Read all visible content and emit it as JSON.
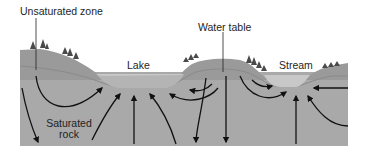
{
  "diagram": {
    "type": "groundwater-flow-cross-section",
    "labels": {
      "unsaturated_zone": "Unsaturated zone",
      "water_table": "Water table",
      "lake": "Lake",
      "stream": "Stream",
      "saturated_rock_line1": "Saturated",
      "saturated_rock_line2": "rock"
    },
    "colors": {
      "background": "#ffffff",
      "unsaturated": "#9a9a9a",
      "saturated": "#a9a9a9",
      "water": "#c8c8c8",
      "trees": "#4a4a4a",
      "arrows": "#111111",
      "text": "#1e1e1e"
    }
  }
}
